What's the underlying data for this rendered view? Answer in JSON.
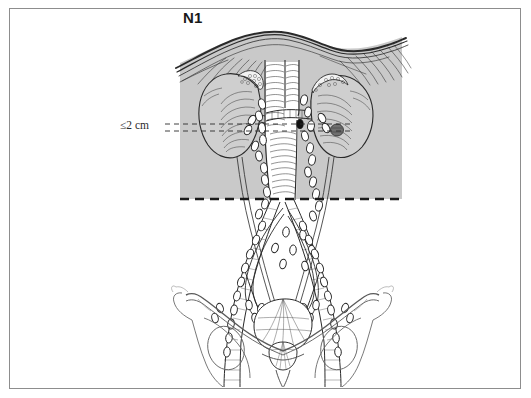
{
  "figure": {
    "title_label": "N1",
    "measure_label": "≤2 cm",
    "caption": "",
    "stage": "N1",
    "border_color": "#8d8d8d",
    "shade_color": "#c9c9c9",
    "ink_color": "#231f20",
    "background_color": "#ffffff"
  },
  "annotations": {
    "node_size_criterion": "≤2 cm",
    "stage_designation": "N1",
    "shaded_region_name": "retroperitoneal-nodal-field",
    "boundary_line_name": "aortic-bifurcation-boundary"
  },
  "anatomy": {
    "structures": [
      {
        "name": "diaphragm",
        "label": "Diaphragm"
      },
      {
        "name": "left-kidney",
        "label": "Left kidney"
      },
      {
        "name": "right-kidney",
        "label": "Right kidney"
      },
      {
        "name": "left-adrenal-gland",
        "label": "Left adrenal gland"
      },
      {
        "name": "right-adrenal-gland",
        "label": "Right adrenal gland"
      },
      {
        "name": "inferior-vena-cava",
        "label": "Inferior vena cava"
      },
      {
        "name": "abdominal-aorta",
        "label": "Abdominal aorta"
      },
      {
        "name": "left-renal-vein",
        "label": "Left renal vein"
      },
      {
        "name": "right-renal-artery",
        "label": "Right renal artery"
      },
      {
        "name": "common-iliac-vessels",
        "label": "Common iliac vessels"
      },
      {
        "name": "external-iliac-vessels",
        "label": "External iliac vessels"
      },
      {
        "name": "internal-iliac-vessels",
        "label": "Internal iliac vessels"
      },
      {
        "name": "urinary-bladder",
        "label": "Urinary bladder"
      },
      {
        "name": "prostate",
        "label": "Prostate"
      },
      {
        "name": "ureter-left",
        "label": "Left ureter"
      },
      {
        "name": "ureter-right",
        "label": "Right ureter"
      },
      {
        "name": "pelvic-bone-left",
        "label": "Left hemipelvis"
      },
      {
        "name": "pelvic-bone-right",
        "label": "Right hemipelvis"
      },
      {
        "name": "lymph-nodes",
        "label": "Lymph nodes"
      },
      {
        "name": "involved-lymph-node",
        "label": "Involved (positive) lymph node"
      }
    ]
  }
}
